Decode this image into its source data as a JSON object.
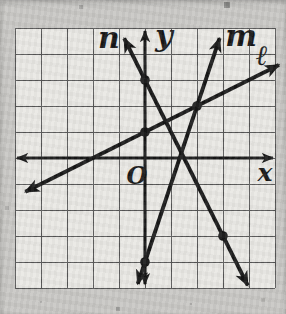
{
  "chart_data": {
    "type": "line",
    "title": "",
    "xlabel": "x",
    "ylabel": "y",
    "origin_label": "O",
    "xlim": [
      -5,
      5
    ],
    "ylim": [
      -5,
      5
    ],
    "grid": true,
    "grid_cells": 10,
    "legend": "none",
    "lines": [
      {
        "label": "n",
        "slope": -2,
        "y_intercept": 3,
        "equation": "y = -2x + 3",
        "draw_range_x": [
          -0.8,
          3.95
        ],
        "marked_points": [
          [
            0,
            3
          ],
          [
            3,
            -3
          ]
        ]
      },
      {
        "label": "m",
        "slope": 3,
        "y_intercept": -4,
        "equation": "y = 3x - 4",
        "draw_range_x": [
          -0.28,
          2.87
        ],
        "marked_points": [
          [
            2,
            2
          ],
          [
            0,
            -4
          ]
        ]
      },
      {
        "label": "ℓ",
        "slope": 0.5,
        "y_intercept": 1,
        "equation": "y = 0.5x + 1",
        "draw_range_x": [
          -4.6,
          5.15
        ],
        "marked_points": [
          [
            0,
            1
          ],
          [
            2,
            2
          ]
        ]
      }
    ],
    "marked_points": [
      [
        0,
        3
      ],
      [
        0,
        1
      ],
      [
        2,
        2
      ],
      [
        3,
        -3
      ],
      [
        0,
        -4
      ]
    ],
    "colors": {
      "ink": "#171717",
      "grid_line": "#565656",
      "grid_bg": "#e9e8e4",
      "paper": "#c8c7c4"
    }
  }
}
